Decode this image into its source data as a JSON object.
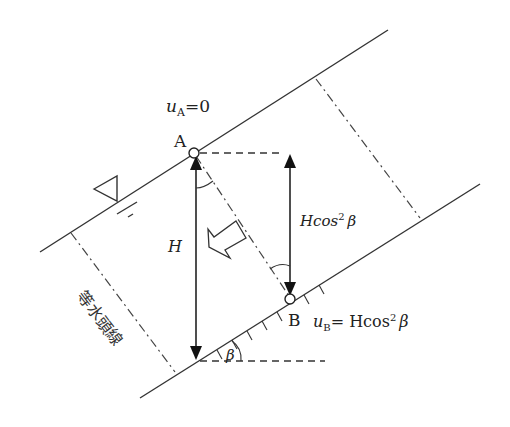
{
  "diagram": {
    "labels": {
      "point_a": "A",
      "point_b": "B",
      "u_a_symbol": "u",
      "u_a_subscript": "A",
      "u_a_value": "=0",
      "u_b_symbol": "u",
      "u_b_subscript": "B",
      "u_b_value": "= Hcos",
      "u_b_exp": "2",
      "u_b_beta": "β",
      "height": "H",
      "hcos_h": "Hcos",
      "hcos_exp": "2",
      "hcos_beta": "β",
      "angle": "β",
      "equipotential": "等水頭線"
    },
    "symbols": {
      "water_table": "water-level-triangle",
      "flow_direction": "hollow-arrow"
    },
    "colors": {
      "line": "#333333",
      "background": "#ffffff"
    }
  }
}
